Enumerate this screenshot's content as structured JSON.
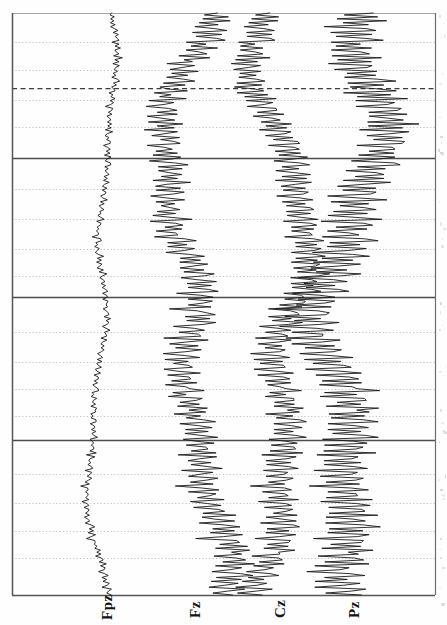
{
  "figure": {
    "title": "",
    "orientation": "rotated-90",
    "background_color": "#fefefe",
    "trace_color": "#1a1a1a",
    "axis_color": "#555555",
    "major_line_color": "#4d4d4d",
    "minor_grid_color": "#aaaaaa",
    "marker_line_color": "#333333",
    "plot_left": 12,
    "plot_right": 435,
    "plot_top": 13,
    "plot_bottom": 595
  },
  "axes": {
    "left_axis_x": 12,
    "right_axis_x": 435,
    "top_axis_y": 13,
    "bottom_axis_y": 595
  },
  "channels": [
    {
      "label": "Fpz",
      "baseline_x": 101,
      "amplitude_scale": 13,
      "label_x": 100,
      "label_y": 620
    },
    {
      "label": "Fz",
      "baseline_x": 189,
      "amplitude_scale": 30,
      "label_x": 188,
      "label_y": 618
    },
    {
      "label": "Cz",
      "baseline_x": 274,
      "amplitude_scale": 30,
      "label_x": 273,
      "label_y": 618
    },
    {
      "label": "Pz",
      "baseline_x": 348,
      "amplitude_scale": 36,
      "label_x": 347,
      "label_y": 618
    }
  ],
  "gridlines": {
    "major_solid_y": [
      158,
      297,
      440
    ],
    "dashed_marker_y": [
      88
    ],
    "minor_dotted_y": [
      42,
      70,
      100,
      127,
      189,
      219,
      249,
      276,
      332,
      362,
      389,
      416,
      474,
      503,
      531,
      558
    ]
  },
  "chart_data": {
    "type": "line",
    "title": "",
    "subtitle": "",
    "xlabel": "",
    "ylabel": "",
    "legend_position": "bottom",
    "grid": true,
    "orientation": "vertical-time-axis",
    "axis_ranges": {
      "time_px": [
        13,
        595
      ],
      "amplitude_px": [
        12,
        435
      ]
    },
    "series": [
      {
        "name": "Fpz",
        "baseline_x": 101,
        "values": [
          2,
          -1,
          3,
          -2,
          4,
          -1,
          2,
          -3,
          1,
          4,
          -2,
          3,
          -1,
          2,
          5,
          -3,
          2,
          -1,
          4,
          -2,
          1,
          3,
          -2,
          5,
          -1,
          2,
          -4,
          3,
          1,
          -2,
          4,
          -1,
          3,
          -2,
          2,
          5,
          -1,
          3,
          -2,
          1,
          4,
          -3,
          2,
          -1,
          5,
          -2,
          3,
          1,
          -4,
          2,
          3,
          -1,
          4,
          -2,
          1,
          3,
          -2,
          5,
          -1,
          2,
          -3,
          4,
          1,
          -2,
          3,
          -1,
          2,
          4,
          -3,
          1,
          2,
          -1,
          3,
          -2,
          4,
          1,
          -3,
          2,
          5,
          -1,
          3,
          -2,
          1,
          4,
          -1,
          2,
          -3,
          5,
          1,
          -2,
          3,
          -1,
          4,
          2,
          -3,
          1,
          5,
          -2,
          3,
          -1,
          2,
          4,
          -1,
          3,
          -2,
          1,
          5,
          -3,
          2,
          4,
          -1,
          3,
          -2,
          1,
          2,
          -4,
          3,
          5,
          -1,
          2,
          -2,
          4,
          1,
          -3,
          2,
          5,
          -1,
          3,
          -2,
          4,
          1,
          -2,
          3,
          -1,
          5,
          2,
          -3,
          1,
          4,
          -2,
          3,
          -1,
          2,
          5,
          -4,
          1,
          3,
          -2,
          4,
          2,
          -1,
          3,
          -5,
          1,
          2,
          4,
          -2,
          3,
          -1,
          5,
          2,
          -3,
          1,
          4,
          -1,
          2,
          3,
          -4,
          5,
          1,
          -2,
          3,
          -1,
          4,
          2,
          -3,
          1,
          5,
          -2,
          3,
          -1,
          2,
          4,
          -3,
          1,
          5,
          -2,
          2,
          3,
          -1,
          4,
          -2,
          1,
          3,
          5,
          -2,
          1,
          -3,
          4,
          2,
          -1,
          3,
          -2,
          5,
          1,
          4,
          -3,
          2,
          -1,
          3,
          5,
          -2,
          1,
          4,
          -2,
          3,
          -1,
          2,
          5,
          -3,
          1,
          4,
          -2,
          3,
          2,
          -1,
          5,
          -3,
          4,
          1,
          -2,
          3,
          -1,
          2,
          5,
          -4,
          3,
          1,
          -2,
          4,
          2,
          -1,
          3,
          -5,
          1,
          4,
          -2,
          3,
          2,
          -1,
          5,
          -3,
          1,
          4,
          -2,
          2,
          3,
          -1,
          5,
          -2,
          1,
          4,
          -3,
          2,
          5,
          -1,
          3,
          -2,
          4,
          1,
          -5,
          2,
          3,
          -1,
          4,
          -2,
          5,
          1,
          3,
          -3,
          2,
          4,
          -1,
          5,
          -2,
          3,
          1,
          -4,
          2,
          5,
          -1,
          3,
          -2,
          4,
          1,
          -3,
          5,
          2,
          -1,
          4
        ]
      },
      {
        "name": "Fz",
        "baseline_x": 189,
        "values": [
          4,
          -3,
          8,
          -5,
          10,
          -4,
          6,
          -8,
          3,
          9,
          -6,
          7,
          -3,
          5,
          12,
          -7,
          4,
          -3,
          9,
          -5,
          3,
          7,
          -5,
          11,
          -3,
          5,
          -9,
          7,
          2,
          -5,
          9,
          -3,
          7,
          -4,
          5,
          11,
          -3,
          7,
          -5,
          2,
          9,
          -7,
          5,
          -3,
          12,
          -5,
          7,
          2,
          -9,
          5,
          7,
          -3,
          9,
          -5,
          2,
          7,
          -5,
          12,
          -3,
          5,
          -7,
          9,
          2,
          -5,
          7,
          -3,
          5,
          9,
          -7,
          2,
          5,
          -3,
          7,
          -5,
          9,
          2,
          -7,
          5,
          12,
          -3,
          7,
          -5,
          2,
          9,
          -3,
          5,
          -7,
          12,
          2,
          -5,
          7,
          -3,
          9,
          5,
          -7,
          2,
          12,
          -5,
          7,
          -3,
          5,
          9,
          -3,
          7,
          -5,
          2,
          12,
          -7,
          5,
          9,
          -3,
          7,
          -5,
          2,
          5,
          -9,
          7,
          12,
          -3,
          5,
          -5,
          9,
          2,
          -7,
          5,
          12,
          -3,
          7,
          -5,
          9,
          2,
          -5,
          7,
          -3,
          12,
          5,
          -7,
          2,
          9,
          -5,
          7,
          -3,
          5,
          12,
          -9,
          2,
          7,
          -5,
          9,
          5,
          -3,
          7,
          -12,
          2,
          5,
          9,
          -5,
          7,
          -3,
          12,
          5,
          -7,
          2,
          9,
          -3,
          5,
          7,
          -9,
          12,
          2,
          -5,
          7,
          -3,
          9,
          5,
          -7,
          2,
          12,
          -5,
          7,
          -3,
          5,
          9,
          -7,
          2,
          12,
          -5,
          5,
          7,
          -3,
          9,
          -5,
          2,
          7,
          12,
          -5,
          2,
          -7,
          9,
          5,
          -3,
          7,
          -5,
          12,
          2,
          9,
          -7,
          5,
          -3,
          7,
          12,
          -5,
          2,
          9,
          -5,
          7,
          -3,
          5,
          12,
          -7,
          2,
          9,
          -5,
          7,
          5,
          -3,
          12,
          -7,
          9,
          2,
          -5,
          7,
          -3,
          5,
          12,
          -9,
          7,
          2,
          -5,
          9,
          5,
          -3,
          7,
          -12,
          2,
          9,
          -5,
          7,
          5,
          -3,
          12,
          -7,
          2,
          9,
          -5,
          5,
          7,
          -3,
          12,
          -5,
          2,
          9,
          -7,
          5,
          12,
          -3,
          7,
          -5,
          9,
          2,
          -12,
          5,
          7,
          -3,
          9,
          -5,
          12,
          2,
          7,
          -7,
          5,
          9,
          -3,
          12,
          -5,
          7,
          2,
          -9,
          5,
          12,
          -3,
          7,
          -5,
          9,
          2,
          -7,
          12,
          5,
          -3,
          9
        ]
      },
      {
        "name": "Cz",
        "baseline_x": 274,
        "values": [
          3,
          -4,
          7,
          -6,
          9,
          -5,
          5,
          -9,
          4,
          8,
          -7,
          6,
          -4,
          6,
          11,
          -8,
          3,
          -4,
          8,
          -6,
          4,
          6,
          -6,
          10,
          -4,
          6,
          -8,
          6,
          3,
          -6,
          8,
          -4,
          6,
          -5,
          6,
          10,
          -4,
          6,
          -6,
          3,
          8,
          -8,
          6,
          -4,
          11,
          -6,
          6,
          3,
          -8,
          6,
          6,
          -4,
          8,
          -6,
          3,
          6,
          -6,
          11,
          -4,
          6,
          -8,
          8,
          3,
          -6,
          6,
          -4,
          6,
          8,
          -8,
          3,
          6,
          -4,
          6,
          -6,
          8,
          3,
          -8,
          6,
          11,
          -4,
          6,
          -6,
          3,
          8,
          -4,
          6,
          -8,
          11,
          3,
          -6,
          6,
          -4,
          8,
          6,
          -8,
          3,
          11,
          -6,
          6,
          -4,
          6,
          8,
          -4,
          6,
          -6,
          3,
          11,
          -8,
          6,
          8,
          -4,
          6,
          -6,
          3,
          6,
          -8,
          6,
          11,
          -4,
          6,
          -6,
          8,
          3,
          -8,
          6,
          11,
          -4,
          6,
          -6,
          8,
          3,
          -6,
          6,
          -4,
          11,
          6,
          -8,
          3,
          8,
          -6,
          6,
          -4,
          6,
          11,
          -8,
          3,
          6,
          -6,
          8,
          6,
          -4,
          6,
          -11,
          3,
          6,
          8,
          -6,
          6,
          -4,
          11,
          6,
          -8,
          3,
          8,
          -4,
          6,
          6,
          -8,
          11,
          3,
          -6,
          6,
          -4,
          8,
          6,
          -8,
          3,
          11,
          -6,
          6,
          -4,
          6,
          8,
          -8,
          3,
          11,
          -6,
          6,
          6,
          -4,
          8,
          -6,
          3,
          6,
          11,
          -6,
          3,
          -8,
          8,
          6,
          -4,
          6,
          -6,
          11,
          3,
          8,
          -8,
          6,
          -4,
          6,
          11,
          -6,
          3,
          8,
          -6,
          6,
          -4,
          6,
          11,
          -8,
          3,
          8,
          -6,
          6,
          6,
          -4,
          11,
          -8,
          8,
          3,
          -6,
          6,
          -4,
          6,
          11,
          -8,
          6,
          3,
          -6,
          8,
          6,
          -4,
          6,
          -11,
          3,
          8,
          -6,
          6,
          6,
          -4,
          11,
          -8,
          3,
          8,
          -6,
          6,
          6,
          -4,
          11,
          -6,
          3,
          8,
          -8,
          6,
          11,
          -4,
          6,
          -6,
          8,
          3,
          -11,
          6,
          6,
          -4,
          8,
          -6,
          11,
          3,
          6,
          -8,
          6,
          8,
          -4,
          11,
          -6,
          6,
          3,
          -8,
          6,
          11,
          -4,
          6,
          -6,
          8,
          3,
          -8,
          11,
          6,
          -4,
          8
        ]
      },
      {
        "name": "Pz",
        "baseline_x": 348,
        "values": [
          5,
          -5,
          9,
          -7,
          12,
          -6,
          7,
          -11,
          5,
          10,
          -8,
          8,
          -5,
          7,
          14,
          -9,
          5,
          -5,
          10,
          -7,
          5,
          8,
          -7,
          13,
          -5,
          8,
          -10,
          8,
          4,
          -7,
          10,
          -5,
          8,
          -6,
          8,
          13,
          -5,
          8,
          -7,
          4,
          10,
          -9,
          8,
          -5,
          14,
          -7,
          8,
          4,
          -10,
          8,
          8,
          -5,
          10,
          -7,
          4,
          8,
          -7,
          14,
          -5,
          8,
          -9,
          10,
          4,
          -7,
          8,
          -5,
          8,
          10,
          -9,
          4,
          8,
          -5,
          8,
          -7,
          10,
          4,
          -9,
          8,
          14,
          -5,
          8,
          -7,
          4,
          10,
          -5,
          8,
          -9,
          14,
          4,
          -7,
          8,
          -5,
          10,
          8,
          -9,
          4,
          14,
          -7,
          8,
          -5,
          8,
          10,
          -5,
          8,
          -7,
          4,
          14,
          -9,
          8,
          10,
          -5,
          8,
          -7,
          4,
          8,
          -10,
          8,
          14,
          -5,
          8,
          -7,
          10,
          4,
          -9,
          8,
          14,
          -5,
          8,
          -7,
          10,
          4,
          -7,
          8,
          -5,
          14,
          8,
          -9,
          4,
          10,
          -7,
          8,
          -5,
          8,
          14,
          -10,
          4,
          8,
          -7,
          10,
          8,
          -5,
          8,
          -14,
          4,
          8,
          10,
          -7,
          8,
          -5,
          14,
          8,
          -9,
          4,
          10,
          -5,
          8,
          8,
          -10,
          14,
          4,
          -7,
          8,
          -5,
          10,
          8,
          -9,
          4,
          14,
          -7,
          8,
          -5,
          8,
          10,
          -9,
          4,
          14,
          -7,
          8,
          8,
          -5,
          10,
          -7,
          4,
          8,
          14,
          -7,
          4,
          -9,
          10,
          8,
          -5,
          8,
          -7,
          14,
          4,
          10,
          -9,
          8,
          -5,
          8,
          14,
          -7,
          4,
          10,
          -7,
          8,
          -5,
          8,
          14,
          -9,
          4,
          10,
          -7,
          8,
          8,
          -5,
          14,
          -9,
          10,
          4,
          -7,
          8,
          -5,
          8,
          14,
          -10,
          8,
          4,
          -7,
          10,
          8,
          -5,
          8,
          -14,
          4,
          10,
          -7,
          8,
          8,
          -5,
          14,
          -9,
          4,
          10,
          -7,
          8,
          8,
          -5,
          14,
          -7,
          4,
          10,
          -9,
          8,
          14,
          -5,
          8,
          -7,
          10,
          4,
          -14,
          8,
          8,
          -5,
          10,
          -7,
          14,
          4,
          8,
          -9,
          8,
          10,
          -5,
          14,
          -7,
          8,
          4,
          -10,
          8,
          14,
          -5,
          8,
          -7,
          10,
          4,
          -9,
          14,
          8,
          -5,
          10
        ]
      }
    ]
  }
}
